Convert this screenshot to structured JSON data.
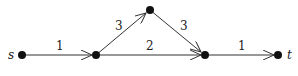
{
  "graph": {
    "colors": {
      "node": "#111111",
      "edge": "#333333",
      "label": "#222222",
      "background": "#ffffff"
    },
    "nodes": [
      {
        "id": "s",
        "label": "s",
        "x": 22,
        "y": 55
      },
      {
        "id": "a",
        "label": "",
        "x": 96,
        "y": 55
      },
      {
        "id": "b",
        "label": "",
        "x": 150,
        "y": 10
      },
      {
        "id": "c",
        "label": "",
        "x": 205,
        "y": 55
      },
      {
        "id": "t",
        "label": "t",
        "x": 278,
        "y": 55
      }
    ],
    "edges": [
      {
        "from": "s",
        "to": "a",
        "weight": "1"
      },
      {
        "from": "a",
        "to": "b",
        "weight": "3"
      },
      {
        "from": "b",
        "to": "c",
        "weight": "3"
      },
      {
        "from": "a",
        "to": "c",
        "weight": "2"
      },
      {
        "from": "c",
        "to": "t",
        "weight": "1"
      }
    ]
  }
}
